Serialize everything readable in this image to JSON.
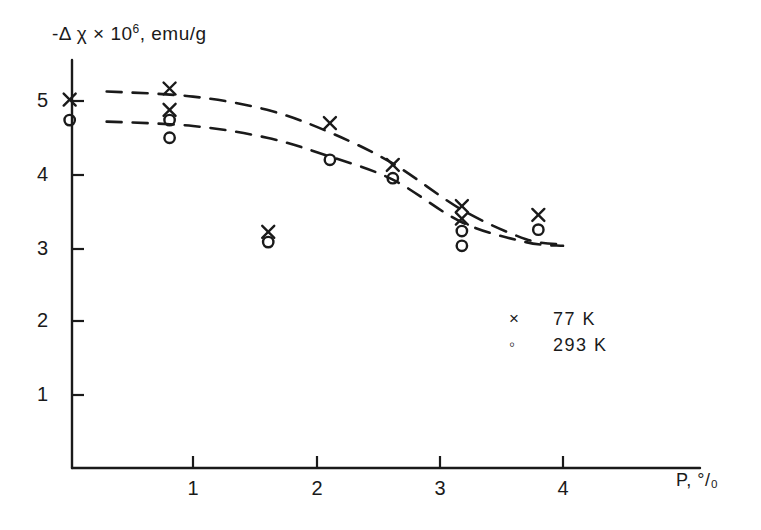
{
  "chart_data": {
    "type": "scatter",
    "title": "",
    "ylabel": "-Δ χ × 10⁶, emu/g",
    "ylabel_parts": {
      "main": "-Δ χ × 10",
      "exponent": "6",
      "units": ", emu/g"
    },
    "xlabel": "P, °/₀",
    "xlim": [
      0,
      4.35
    ],
    "ylim": [
      0,
      5.5
    ],
    "xticks": [
      1,
      2,
      3,
      4
    ],
    "yticks": [
      1,
      2,
      3,
      4,
      5
    ],
    "grid": false,
    "legend_position": "lower-right",
    "series": [
      {
        "name": "77 K",
        "marker": "x",
        "points": [
          {
            "x": 0.0,
            "y": 5.02
          },
          {
            "x": 0.81,
            "y": 5.17
          },
          {
            "x": 0.81,
            "y": 4.88
          },
          {
            "x": 1.61,
            "y": 3.22
          },
          {
            "x": 2.11,
            "y": 4.7
          },
          {
            "x": 2.62,
            "y": 4.13
          },
          {
            "x": 3.18,
            "y": 3.57
          },
          {
            "x": 3.18,
            "y": 3.4
          },
          {
            "x": 3.8,
            "y": 3.45
          }
        ]
      },
      {
        "name": "293 K",
        "marker": "o",
        "points": [
          {
            "x": 0.0,
            "y": 4.74
          },
          {
            "x": 0.81,
            "y": 4.74
          },
          {
            "x": 0.81,
            "y": 4.5
          },
          {
            "x": 1.61,
            "y": 3.08
          },
          {
            "x": 2.11,
            "y": 4.2
          },
          {
            "x": 2.62,
            "y": 3.95
          },
          {
            "x": 3.18,
            "y": 3.23
          },
          {
            "x": 3.18,
            "y": 3.03
          },
          {
            "x": 3.8,
            "y": 3.25
          }
        ]
      }
    ],
    "trend_curves": [
      {
        "name": "77 K trend",
        "style": "dashed",
        "points": [
          {
            "x": 0.3,
            "y": 5.13
          },
          {
            "x": 1.0,
            "y": 5.06
          },
          {
            "x": 1.6,
            "y": 4.88
          },
          {
            "x": 2.1,
            "y": 4.58
          },
          {
            "x": 2.62,
            "y": 4.15
          },
          {
            "x": 3.18,
            "y": 3.52
          },
          {
            "x": 3.7,
            "y": 3.12
          },
          {
            "x": 4.0,
            "y": 3.05
          }
        ]
      },
      {
        "name": "293 K trend",
        "style": "dashed",
        "points": [
          {
            "x": 0.3,
            "y": 4.72
          },
          {
            "x": 1.0,
            "y": 4.66
          },
          {
            "x": 1.6,
            "y": 4.5
          },
          {
            "x": 2.1,
            "y": 4.25
          },
          {
            "x": 2.62,
            "y": 3.93
          },
          {
            "x": 3.18,
            "y": 3.35
          },
          {
            "x": 3.7,
            "y": 3.08
          },
          {
            "x": 4.0,
            "y": 3.03
          }
        ]
      }
    ],
    "legend": [
      {
        "marker": "x",
        "label": "77 K"
      },
      {
        "marker": "o",
        "label": "293 K"
      }
    ],
    "colors": {
      "ink": "#1a1a1a",
      "background": "#ffffff"
    },
    "xtick_labels": [
      "1",
      "2",
      "3",
      "4"
    ],
    "ytick_labels": [
      "1",
      "2",
      "3",
      "4",
      "5"
    ]
  }
}
